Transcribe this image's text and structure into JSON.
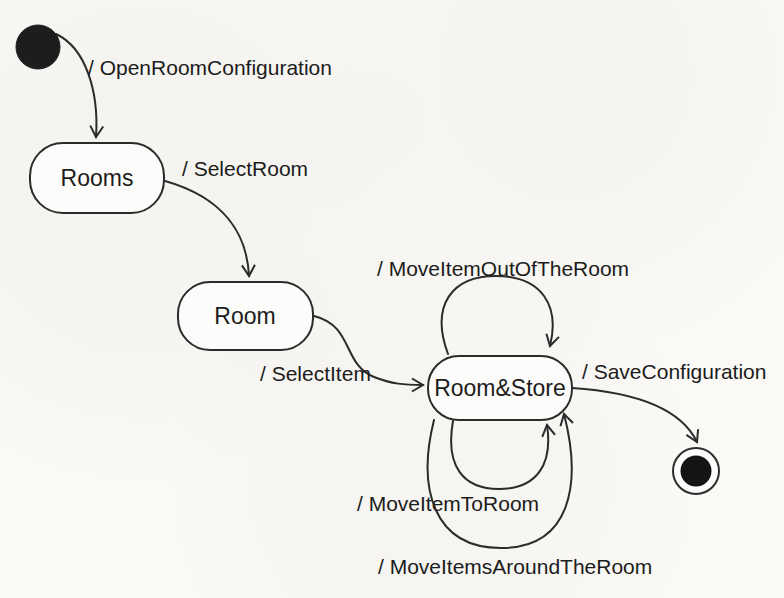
{
  "diagram": {
    "kind": "uml-state-machine",
    "states": {
      "initial": {
        "name": "initial pseudo-state"
      },
      "rooms": {
        "label": "Rooms"
      },
      "room": {
        "label": "Room"
      },
      "room_store": {
        "label": "Room&Store"
      },
      "final": {
        "name": "final state"
      }
    },
    "transitions": {
      "open_room_configuration": {
        "from": "initial",
        "to": "Rooms",
        "label": "/ OpenRoomConfiguration"
      },
      "select_room": {
        "from": "Rooms",
        "to": "Room",
        "label": "/ SelectRoom"
      },
      "select_item": {
        "from": "Room",
        "to": "Room&Store",
        "label": "/ SelectItem"
      },
      "move_item_out_of_the_room": {
        "from": "Room&Store",
        "to": "Room&Store",
        "label": "/ MoveItemOutOfTheRoom"
      },
      "move_item_to_room": {
        "from": "Room&Store",
        "to": "Room&Store",
        "label": "/ MoveItemToRoom"
      },
      "move_items_around_the_room": {
        "from": "Room&Store",
        "to": "Room&Store",
        "label": "/ MoveItemsAroundTheRoom"
      },
      "save_configuration": {
        "from": "Room&Store",
        "to": "final",
        "label": "/ SaveConfiguration"
      }
    },
    "colors": {
      "background": "#faf9f6",
      "line": "#2b2b2b",
      "text": "#1c1c1c",
      "state_fill": "#fcfcfa",
      "initial_fill": "#1d1d1d",
      "final_fill": "#141414"
    }
  }
}
